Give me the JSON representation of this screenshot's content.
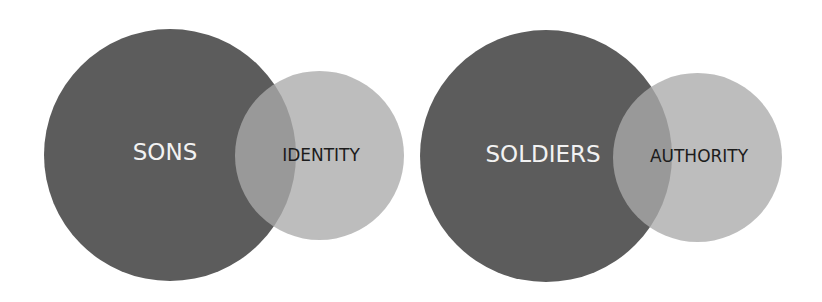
{
  "diagrams": [
    {
      "primary": {
        "label": "SONS",
        "color": "#5c5c5c"
      },
      "secondary": {
        "label": "IDENTITY",
        "color": "#b0b0b0"
      }
    },
    {
      "primary": {
        "label": "SOLDIERS",
        "color": "#5c5c5c"
      },
      "secondary": {
        "label": "AUTHORITY",
        "color": "#b0b0b0"
      }
    }
  ]
}
